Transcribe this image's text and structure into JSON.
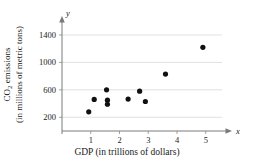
{
  "chart_data": {
    "type": "scatter",
    "title": "",
    "xlabel": "GDP (in trillions of dollars)",
    "ylabel_line1": "CO",
    "ylabel_sub": "2",
    "ylabel_line1_rest": " emissions",
    "ylabel_line2": "(in millions of metric tons)",
    "x_axis_name": "x",
    "y_axis_name": "y",
    "xlim": [
      0,
      5.6
    ],
    "ylim": [
      0,
      1560
    ],
    "xticks": [
      1,
      2,
      3,
      4,
      5
    ],
    "xtick_labels": [
      "1",
      "2",
      "3",
      "4",
      "5"
    ],
    "yticks": [
      200,
      600,
      1000,
      1400
    ],
    "ytick_labels": [
      "200",
      "600",
      "1000",
      "1400"
    ],
    "grid": "horizontal",
    "legend": "none",
    "marker": "filled-circle",
    "marker_color": "#111111",
    "points": [
      {
        "x": 0.93,
        "y": 280
      },
      {
        "x": 1.12,
        "y": 460
      },
      {
        "x": 1.55,
        "y": 600
      },
      {
        "x": 1.58,
        "y": 450
      },
      {
        "x": 1.58,
        "y": 390
      },
      {
        "x": 2.3,
        "y": 465
      },
      {
        "x": 2.7,
        "y": 580
      },
      {
        "x": 2.9,
        "y": 430
      },
      {
        "x": 3.6,
        "y": 830
      },
      {
        "x": 4.9,
        "y": 1220
      }
    ]
  }
}
